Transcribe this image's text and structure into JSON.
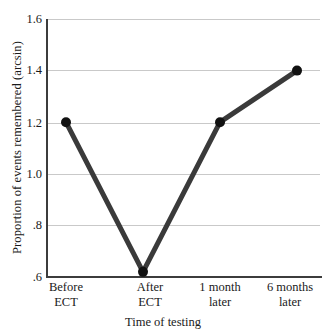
{
  "chart_data": {
    "type": "line",
    "title": "",
    "subtitle": "",
    "xlabel": "Time of testing",
    "ylabel": "Proportion of events remembered (arcsin)",
    "categories": [
      "Before ECT",
      "After ECT",
      "1 month later",
      "6 months later"
    ],
    "category_lines": [
      [
        "Before",
        "ECT"
      ],
      [
        "After",
        "ECT"
      ],
      [
        "1 month",
        "later"
      ],
      [
        "6 months",
        "later"
      ]
    ],
    "values": [
      1.2,
      0.62,
      1.2,
      1.4
    ],
    "series": [
      {
        "name": "Proportion of events remembered",
        "values": [
          1.2,
          0.62,
          1.2,
          1.4
        ]
      }
    ],
    "ylim": [
      0.6,
      1.6
    ],
    "xlim": [
      0,
      3
    ],
    "yticks": [
      1.6,
      1.4,
      1.2,
      1.0,
      0.8,
      0.6
    ],
    "ytick_labels": [
      "1.6",
      "1.4",
      "1.2",
      "1.0",
      ".8",
      ".6"
    ],
    "grid": true,
    "grid_axis": "y",
    "legend": false,
    "legend_position": "none",
    "marker": "circle",
    "annotations": []
  },
  "style": {
    "line_color": "#3a3a3a",
    "marker_color": "#111111",
    "grid_color": "#c9c9c9",
    "axis_color": "#3c3c3c",
    "background": "#ffffff",
    "text_color": "#1a1a1a"
  }
}
